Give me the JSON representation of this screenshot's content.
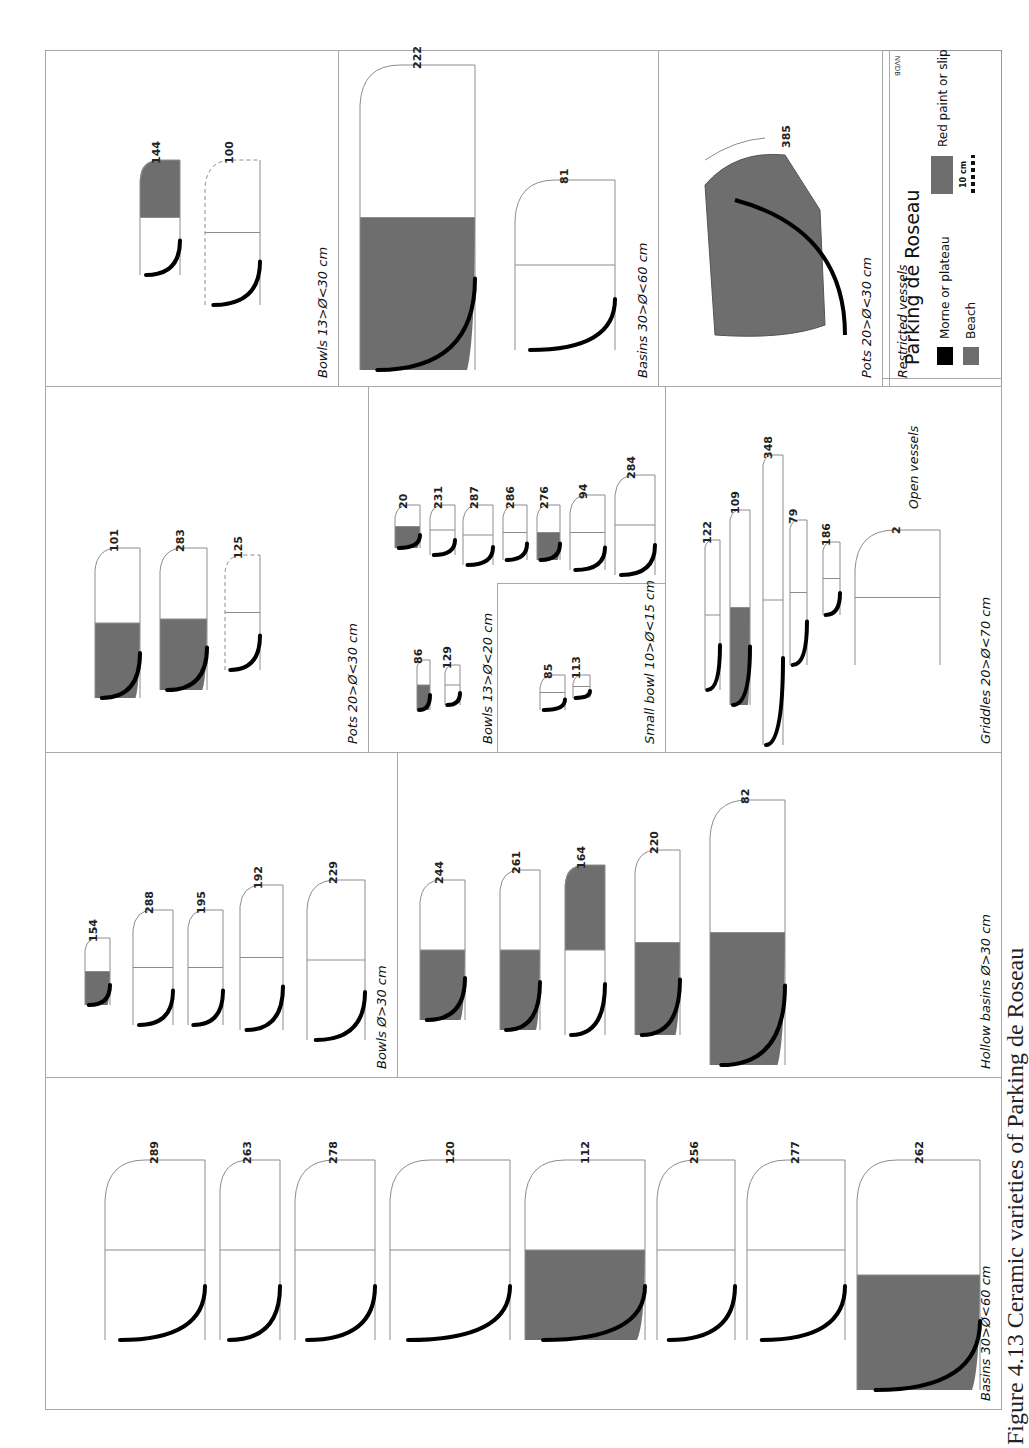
{
  "figure": {
    "site": "Parking de Roseau",
    "caption": "Figure 4.13 Ceramic varieties of Parking de Roseau",
    "credit": "NVDB",
    "orientation": "rotated 90° counter-clockwise",
    "groups": {
      "open": "Open vessels",
      "restricted": "Restricted vessels"
    },
    "colors": {
      "morne": "#000000",
      "beach": "#6e6e6e",
      "red_paint": "#6e6e6e",
      "line": "#8c8c8c"
    },
    "panels": [
      {
        "id": "basins-open",
        "title": "Basins 30>Ø<60 cm",
        "vessels": [
          "289",
          "263",
          "278",
          "120",
          "112",
          "256",
          "277",
          "262"
        ]
      },
      {
        "id": "bowls-large",
        "title": "Bowls Ø>30 cm",
        "vessels": [
          "154",
          "288",
          "195",
          "192",
          "229"
        ]
      },
      {
        "id": "hollow-basins",
        "title": "Hollow basins Ø>30 cm",
        "vessels": [
          "244",
          "261",
          "164",
          "220",
          "82"
        ]
      },
      {
        "id": "pots-open",
        "title": "Pots 20>Ø<30 cm",
        "vessels": [
          "101",
          "283",
          "125"
        ]
      },
      {
        "id": "bowls-medium",
        "title": "Bowls 13>Ø<20 cm",
        "vessels": [
          "86",
          "129",
          "20",
          "231",
          "287",
          "286",
          "276",
          "94",
          "284"
        ]
      },
      {
        "id": "small-bowl",
        "title": "Small bowl 10>Ø<15 cm",
        "vessels": [
          "85",
          "113"
        ]
      },
      {
        "id": "griddles",
        "title": "Griddles 20>Ø<70 cm",
        "vessels": [
          "122",
          "109",
          "348",
          "79",
          "186",
          "2"
        ]
      },
      {
        "id": "bowls-restricted",
        "title": "Bowls 13>Ø<30 cm",
        "vessels": [
          "144",
          "100"
        ]
      },
      {
        "id": "basins-restricted",
        "title": "Basins 30>Ø<60 cm",
        "vessels": [
          "222",
          "81"
        ]
      },
      {
        "id": "pots-restricted",
        "title": "Pots 20>Ø<30 cm",
        "vessels": [
          "385"
        ]
      }
    ],
    "legend": {
      "title": "Parking de Roseau",
      "items": [
        {
          "label": "Morne or plateau",
          "color": "#000000"
        },
        {
          "label": "Beach",
          "color": "#6e6e6e"
        },
        {
          "label": "Red paint or slip",
          "color": "#6e6e6e"
        }
      ],
      "scale": "10 cm"
    }
  },
  "labels": {
    "p289": "289",
    "p263": "263",
    "p278": "278",
    "p120": "120",
    "p112": "112",
    "p256": "256",
    "p277": "277",
    "p262": "262",
    "p154": "154",
    "p288": "288",
    "p195": "195",
    "p192": "192",
    "p229": "229",
    "p244": "244",
    "p261": "261",
    "p164": "164",
    "p220": "220",
    "p82": "82",
    "p101": "101",
    "p283": "283",
    "p125": "125",
    "p86": "86",
    "p129": "129",
    "p20": "20",
    "p231": "231",
    "p287": "287",
    "p286": "286",
    "p276": "276",
    "p94": "94",
    "p284": "284",
    "p85": "85",
    "p113": "113",
    "p122": "122",
    "p109": "109",
    "p348": "348",
    "p79": "79",
    "p186": "186",
    "p2": "2",
    "p144": "144",
    "p100": "100",
    "p222": "222",
    "p81": "81",
    "p385": "385"
  }
}
